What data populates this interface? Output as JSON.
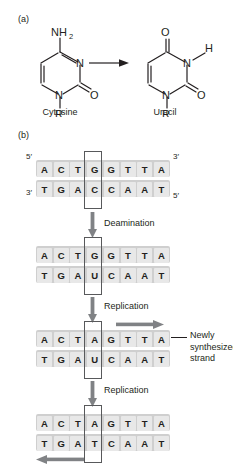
{
  "figure": {
    "panels": [
      {
        "id": "a",
        "label": "(a)"
      },
      {
        "id": "b",
        "label": "(b)"
      }
    ]
  },
  "panel_a": {
    "label": "(a)",
    "reaction_arrow": "right-arrow",
    "molecules": [
      {
        "name": "Cytosine",
        "atoms": {
          "amine": "NH",
          "amine_sub": "2",
          "ring_n3": "N",
          "ring_n1": "N",
          "carbonyl_o": "O",
          "substituent": "R"
        }
      },
      {
        "name": "Uracil",
        "atoms": {
          "carbonyl_o4": "O",
          "ring_n3": "N",
          "ring_nh_h": "H",
          "ring_n1": "N",
          "carbonyl_o2": "O",
          "substituent": "R"
        }
      }
    ]
  },
  "panel_b": {
    "label": "(b)",
    "primes": {
      "top_left": "5′",
      "top_right": "3′",
      "bottom_left": "3′",
      "bottom_right": "5′"
    },
    "steps": [
      {
        "id": "original",
        "top_strand": [
          "A",
          "C",
          "T",
          "G",
          "G",
          "T",
          "T",
          "A"
        ],
        "bottom_strand": [
          "T",
          "G",
          "A",
          "C",
          "C",
          "A",
          "A",
          "T"
        ],
        "boxed_index": 3,
        "show_primes": true
      },
      {
        "id": "after-deamination",
        "top_strand": [
          "A",
          "C",
          "T",
          "G",
          "G",
          "T",
          "T",
          "A"
        ],
        "bottom_strand": [
          "T",
          "G",
          "A",
          "U",
          "C",
          "A",
          "A",
          "T"
        ],
        "boxed_index": 3,
        "show_primes": false
      },
      {
        "id": "after-first-replication",
        "top_strand": [
          "A",
          "C",
          "T",
          "A",
          "G",
          "T",
          "T",
          "A"
        ],
        "bottom_strand": [
          "T",
          "G",
          "A",
          "U",
          "C",
          "A",
          "A",
          "T"
        ],
        "boxed_index": 3,
        "show_primes": false
      },
      {
        "id": "after-second-replication",
        "top_strand": [
          "A",
          "C",
          "T",
          "A",
          "G",
          "T",
          "T",
          "A"
        ],
        "bottom_strand": [
          "T",
          "G",
          "A",
          "T",
          "C",
          "A",
          "A",
          "T"
        ],
        "boxed_index": 3,
        "show_primes": false
      }
    ],
    "transitions": [
      {
        "id": "deamination",
        "label": "Deamination",
        "icon": "down-arrow"
      },
      {
        "id": "replication-1",
        "label": "Replication",
        "icon": "down-arrow"
      },
      {
        "id": "replication-2",
        "label": "Replication",
        "icon": "down-arrow"
      }
    ],
    "annotations": [
      {
        "id": "newly-synthesized-strand",
        "lines": [
          "Newly",
          "synthesized",
          "strand"
        ],
        "leader": "horizontal-line",
        "strand_arrow": "right-arrow"
      },
      {
        "id": "second-newly-synthesized",
        "strand_arrow": "left-arrow"
      }
    ]
  },
  "colors": {
    "text": "#231f20",
    "strand_bar": "#cfcfcf",
    "base_box": "#e8e8e8",
    "outline": "#58595b",
    "arrow": "#808285"
  }
}
